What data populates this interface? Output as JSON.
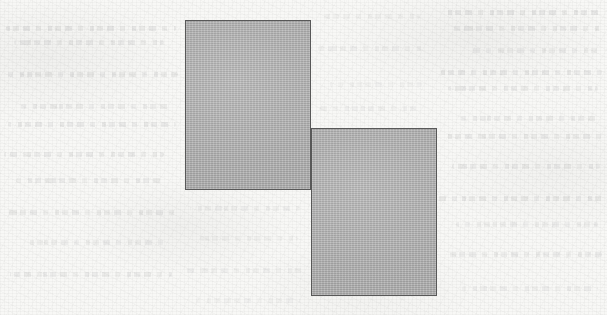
{
  "figure": {
    "medium": "scanned-page",
    "canvas": {
      "width": 607,
      "height": 315
    },
    "background": {
      "name": "paper",
      "color": "#f8f8f6",
      "texture": "paper-grain",
      "show_through_text": true
    },
    "shapes": [
      {
        "id": "rectangle-1",
        "label": "upper-left rectangle",
        "type": "rectangle",
        "x": 185,
        "y": 20,
        "width": 126,
        "height": 170,
        "fill": "#b2b2b2",
        "stroke": "#585858",
        "stroke_width": 1.5
      },
      {
        "id": "rectangle-2",
        "label": "lower-right rectangle",
        "type": "rectangle",
        "x": 311,
        "y": 128,
        "width": 126,
        "height": 168,
        "fill": "#b2b2b2",
        "stroke": "#585858",
        "stroke_width": 1.5
      }
    ],
    "ghost_text_lines": [
      {
        "x": 6,
        "y": 26,
        "width": 170,
        "opacity": 0.55
      },
      {
        "x": 14,
        "y": 40,
        "width": 150,
        "opacity": 0.45
      },
      {
        "x": 2,
        "y": 72,
        "width": 176,
        "opacity": 0.5
      },
      {
        "x": 20,
        "y": 104,
        "width": 152,
        "opacity": 0.42
      },
      {
        "x": 8,
        "y": 122,
        "width": 168,
        "opacity": 0.52
      },
      {
        "x": 4,
        "y": 152,
        "width": 160,
        "opacity": 0.46
      },
      {
        "x": 16,
        "y": 178,
        "width": 150,
        "opacity": 0.44
      },
      {
        "x": 6,
        "y": 210,
        "width": 172,
        "opacity": 0.48
      },
      {
        "x": 24,
        "y": 240,
        "width": 140,
        "opacity": 0.4
      },
      {
        "x": 10,
        "y": 272,
        "width": 162,
        "opacity": 0.44
      },
      {
        "x": 444,
        "y": 10,
        "width": 156,
        "opacity": 0.55
      },
      {
        "x": 452,
        "y": 26,
        "width": 148,
        "opacity": 0.46
      },
      {
        "x": 470,
        "y": 48,
        "width": 128,
        "opacity": 0.4
      },
      {
        "x": 440,
        "y": 70,
        "width": 162,
        "opacity": 0.52
      },
      {
        "x": 448,
        "y": 86,
        "width": 150,
        "opacity": 0.44
      },
      {
        "x": 460,
        "y": 116,
        "width": 140,
        "opacity": 0.42
      },
      {
        "x": 442,
        "y": 134,
        "width": 160,
        "opacity": 0.48
      },
      {
        "x": 452,
        "y": 164,
        "width": 148,
        "opacity": 0.44
      },
      {
        "x": 438,
        "y": 196,
        "width": 166,
        "opacity": 0.5
      },
      {
        "x": 456,
        "y": 222,
        "width": 142,
        "opacity": 0.4
      },
      {
        "x": 444,
        "y": 252,
        "width": 158,
        "opacity": 0.46
      },
      {
        "x": 462,
        "y": 286,
        "width": 136,
        "opacity": 0.38
      },
      {
        "x": 190,
        "y": 206,
        "width": 110,
        "opacity": 0.3
      },
      {
        "x": 200,
        "y": 236,
        "width": 98,
        "opacity": 0.26
      },
      {
        "x": 186,
        "y": 268,
        "width": 118,
        "opacity": 0.3
      },
      {
        "x": 196,
        "y": 298,
        "width": 104,
        "opacity": 0.24
      },
      {
        "x": 324,
        "y": 14,
        "width": 96,
        "opacity": 0.26
      },
      {
        "x": 318,
        "y": 46,
        "width": 106,
        "opacity": 0.3
      },
      {
        "x": 330,
        "y": 82,
        "width": 92,
        "opacity": 0.24
      },
      {
        "x": 320,
        "y": 106,
        "width": 100,
        "opacity": 0.28
      }
    ]
  }
}
